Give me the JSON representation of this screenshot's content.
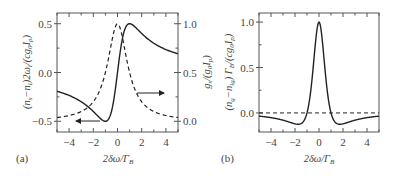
{
  "chart_data": [
    {
      "panel": "(a)",
      "type": "line",
      "xlabel": "2δω/Γ_B",
      "ylabel_left": "(n_s − n_l)2ω_l/(cg_0 I_p)",
      "ylabel_right": "g_s/(g_0 I_p)",
      "xlim": [
        -5,
        5
      ],
      "ylim_left": [
        -0.61,
        0.61
      ],
      "ylim_right": [
        -0.11,
        1.11
      ],
      "xticks": [
        -4,
        -2,
        0,
        2,
        4
      ],
      "yticks_left": [
        -0.5,
        0.0,
        0.5
      ],
      "yticks_right": [
        0.0,
        0.5,
        1.0
      ],
      "grid": false,
      "series": [
        {
          "name": "refractive index difference (left axis)",
          "style": "solid",
          "axis": "left",
          "formula": "x/(1+x^2)",
          "x": [
            -5,
            -4,
            -3,
            -2,
            -1.5,
            -1,
            -0.5,
            0,
            0.5,
            1,
            1.5,
            2,
            3,
            4,
            5
          ],
          "values": [
            -0.19,
            -0.24,
            -0.3,
            -0.4,
            -0.46,
            -0.5,
            -0.4,
            0.0,
            0.4,
            0.5,
            0.46,
            0.4,
            0.3,
            0.24,
            0.19
          ]
        },
        {
          "name": "gain (right axis)",
          "style": "dashed",
          "axis": "right",
          "formula": "1/(1+x^2)",
          "x": [
            -5,
            -4,
            -3,
            -2,
            -1.5,
            -1,
            -0.5,
            0,
            0.5,
            1,
            1.5,
            2,
            3,
            4,
            5
          ],
          "values": [
            0.04,
            0.06,
            0.1,
            0.2,
            0.31,
            0.5,
            0.8,
            1.0,
            0.8,
            0.5,
            0.31,
            0.2,
            0.1,
            0.06,
            0.04
          ]
        }
      ],
      "annotations": [
        {
          "type": "arrow",
          "direction": "left",
          "meaning": "solid curve uses left axis"
        },
        {
          "type": "arrow",
          "direction": "right",
          "meaning": "dashed curve uses right axis"
        }
      ]
    },
    {
      "panel": "(b)",
      "type": "line",
      "xlabel": "2δω/Γ_B",
      "ylabel": "(n_g − n_lg) Γ_B/(cg_0 I_p)",
      "xlim": [
        -5,
        5
      ],
      "ylim": [
        -0.21,
        1.1
      ],
      "xticks": [
        -4,
        -2,
        0,
        2,
        4
      ],
      "yticks": [
        0.0,
        0.5,
        1.0
      ],
      "grid": false,
      "series": [
        {
          "name": "group index difference",
          "style": "solid",
          "formula": "(1-x^2)/(1+x^2)^2",
          "x": [
            -5,
            -4,
            -3,
            -2,
            -1.73,
            -1,
            -0.5,
            0,
            0.5,
            1,
            1.73,
            2,
            3,
            4,
            5
          ],
          "values": [
            -0.04,
            -0.05,
            -0.08,
            -0.12,
            -0.125,
            0.0,
            0.48,
            1.0,
            0.48,
            0.0,
            -0.125,
            -0.12,
            -0.08,
            -0.05,
            -0.04
          ]
        },
        {
          "name": "zero reference",
          "style": "dashed",
          "x": [
            -5,
            5
          ],
          "values": [
            0,
            0
          ]
        }
      ]
    }
  ],
  "panels": {
    "a": {
      "label": "(a)",
      "xlabel_main": "2δω/Γ",
      "xlabel_sub": "B",
      "xticks": [
        "−4",
        "−2",
        "0",
        "2",
        "4"
      ],
      "yticks_left": [
        "0.5",
        "0.0",
        "−0.5"
      ],
      "yticks_right": [
        "1.0",
        "0.5",
        "0.0"
      ],
      "ylabel_left": "(n",
      "ylabel_left_full": "(n_s−n_l)2ω_l/(cg_0 I_p)",
      "ylabel_right_full": "g_s/(g_0 I_p)"
    },
    "b": {
      "label": "(b)",
      "xlabel_main": "2δω/Γ",
      "xlabel_sub": "B",
      "xticks": [
        "−4",
        "−2",
        "0",
        "2",
        "4"
      ],
      "yticks": [
        "1.0",
        "0.5",
        "0.0"
      ],
      "ylabel_full": "(n_g−n_lg) Γ_B/(cg_0 I_p)"
    }
  },
  "colors": {
    "line": "#222222",
    "axis": "#555555",
    "text": "#444444"
  }
}
